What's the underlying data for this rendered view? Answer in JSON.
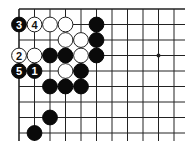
{
  "diagram": {
    "type": "go-board-corner",
    "grid": {
      "origin_x": 19,
      "origin_y": 9,
      "spacing": 15.5,
      "columns": 11,
      "rows": 9,
      "line_extend_right": 185,
      "line_extend_bottom": 141,
      "top_edge": true,
      "left_edge": true
    },
    "colors": {
      "background": "#ffffff",
      "line": "#222222",
      "black_stone": "#0a0a0a",
      "white_stone": "#ffffff",
      "white_stone_border": "#222222"
    },
    "star_points": [
      {
        "col": 9,
        "row": 3
      }
    ],
    "stones": [
      {
        "col": 0,
        "row": 1,
        "color": "black",
        "label": "3"
      },
      {
        "col": 1,
        "row": 1,
        "color": "white",
        "label": "4"
      },
      {
        "col": 2,
        "row": 1,
        "color": "white",
        "label": ""
      },
      {
        "col": 3,
        "row": 1,
        "color": "white",
        "label": ""
      },
      {
        "col": 5,
        "row": 1,
        "color": "black",
        "label": ""
      },
      {
        "col": 3,
        "row": 2,
        "color": "white",
        "label": ""
      },
      {
        "col": 4,
        "row": 2,
        "color": "white",
        "label": ""
      },
      {
        "col": 5,
        "row": 2,
        "color": "black",
        "label": ""
      },
      {
        "col": 0,
        "row": 3,
        "color": "white",
        "label": "2"
      },
      {
        "col": 1,
        "row": 3,
        "color": "white",
        "label": ""
      },
      {
        "col": 2,
        "row": 3,
        "color": "black",
        "label": ""
      },
      {
        "col": 3,
        "row": 3,
        "color": "black",
        "label": ""
      },
      {
        "col": 4,
        "row": 3,
        "color": "white",
        "label": ""
      },
      {
        "col": 5,
        "row": 3,
        "color": "black",
        "label": ""
      },
      {
        "col": 0,
        "row": 4,
        "color": "black",
        "label": "5"
      },
      {
        "col": 1,
        "row": 4,
        "color": "black",
        "label": "1"
      },
      {
        "col": 3,
        "row": 4,
        "color": "white",
        "label": ""
      },
      {
        "col": 4,
        "row": 4,
        "color": "black",
        "label": ""
      },
      {
        "col": 2,
        "row": 5,
        "color": "black",
        "label": ""
      },
      {
        "col": 3,
        "row": 5,
        "color": "black",
        "label": ""
      },
      {
        "col": 4,
        "row": 5,
        "color": "black",
        "label": ""
      },
      {
        "col": 2,
        "row": 7,
        "color": "black",
        "label": ""
      },
      {
        "col": 1,
        "row": 8,
        "color": "black",
        "label": ""
      }
    ]
  }
}
